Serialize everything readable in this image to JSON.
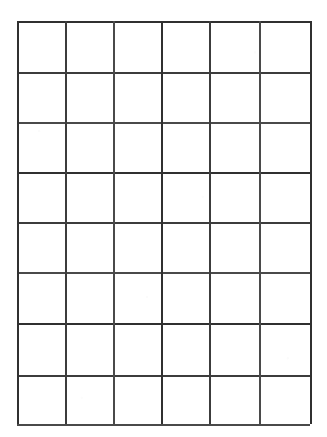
{
  "document": {
    "kind": "blank-grid-worksheet",
    "title": "",
    "visible_text": "",
    "background_color": "#ffffff",
    "ink_color": "#3c3c3c"
  },
  "chart_data": {
    "type": "table",
    "title": "",
    "subtitle": "",
    "xlabel": "",
    "ylabel": "",
    "columns": 6,
    "rows": 8,
    "column_headers": [
      "",
      "",
      "",
      "",
      "",
      ""
    ],
    "row_headers": [
      "",
      "",
      "",
      "",
      "",
      "",
      "",
      ""
    ],
    "cells": [
      [
        "",
        "",
        "",
        "",
        "",
        ""
      ],
      [
        "",
        "",
        "",
        "",
        "",
        ""
      ],
      [
        "",
        "",
        "",
        "",
        "",
        ""
      ],
      [
        "",
        "",
        "",
        "",
        "",
        ""
      ],
      [
        "",
        "",
        "",
        "",
        "",
        ""
      ],
      [
        "",
        "",
        "",
        "",
        "",
        ""
      ],
      [
        "",
        "",
        "",
        "",
        "",
        ""
      ],
      [
        "",
        "",
        "",
        "",
        "",
        ""
      ]
    ],
    "grid": true,
    "legend": [],
    "annotations": []
  },
  "geometry": {
    "image_width": 327,
    "image_height": 437,
    "grid_left": 17,
    "grid_top": 21,
    "grid_right": 310,
    "grid_bottom": 424,
    "line_thickness": 2,
    "vertical_line_x": [
      17,
      65,
      113,
      161,
      209,
      259,
      310
    ],
    "horizontal_line_y": [
      21,
      72,
      122,
      172,
      222,
      272,
      323,
      375,
      424
    ],
    "column_widths": [
      48,
      48,
      48,
      48,
      50,
      51
    ],
    "row_heights": [
      51,
      50,
      50,
      50,
      50,
      51,
      52,
      49
    ]
  }
}
